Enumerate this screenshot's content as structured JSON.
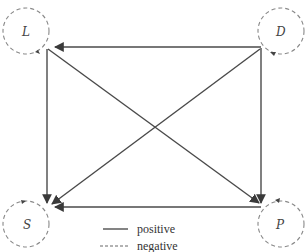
{
  "diagram": {
    "type": "causal-loop",
    "nodes": [
      {
        "id": "L",
        "label": "L",
        "x": 26,
        "y": 31,
        "loop": "negative"
      },
      {
        "id": "D",
        "label": "D",
        "x": 281,
        "y": 31,
        "loop": "negative"
      },
      {
        "id": "S",
        "label": "S",
        "x": 26,
        "y": 224,
        "loop": "negative"
      },
      {
        "id": "P",
        "label": "P",
        "x": 281,
        "y": 224,
        "loop": "negative"
      }
    ],
    "edges": [
      {
        "from": "D",
        "to": "L",
        "sign": "positive"
      },
      {
        "from": "L",
        "to": "S",
        "sign": "positive"
      },
      {
        "from": "L",
        "to": "P",
        "sign": "positive"
      },
      {
        "from": "D",
        "to": "S",
        "sign": "positive"
      },
      {
        "from": "D",
        "to": "P",
        "sign": "positive"
      },
      {
        "from": "P",
        "to": "S",
        "sign": "positive"
      }
    ],
    "legend": {
      "positive_label": "positive",
      "negative_label": "negative"
    },
    "colors": {
      "edge": "#4a4a4a",
      "loop": "#888888"
    }
  }
}
